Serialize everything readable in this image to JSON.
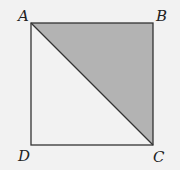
{
  "diagram": {
    "type": "square-with-diagonal",
    "vertices": {
      "A": {
        "label": "A",
        "x": 31,
        "y": 23
      },
      "B": {
        "label": "B",
        "x": 153,
        "y": 23
      },
      "C": {
        "label": "C",
        "x": 153,
        "y": 145
      },
      "D": {
        "label": "D",
        "x": 31,
        "y": 145
      }
    },
    "shaded_region": "triangle ABC",
    "diagonal": "AC",
    "colors": {
      "background": "#f2f2f2",
      "shade": "#b3b3b3",
      "stroke": "#333333"
    }
  }
}
